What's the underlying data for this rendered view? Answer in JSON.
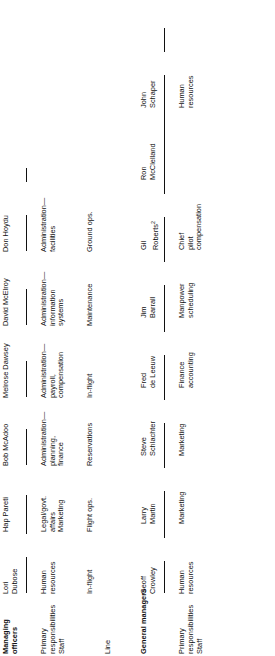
{
  "figure": {
    "type": "org-chart",
    "orientation": "rotated-90-ccw",
    "sections": [
      {
        "id": "managing-officers",
        "title": "Managing\nofficers",
        "row_labels": [
          "Primary\nresponsibilities",
          "Staff",
          "Line"
        ],
        "people": [
          {
            "name": "Lori\nDubose",
            "staff": "Human\nresources",
            "line": "In-flight"
          },
          {
            "name": "Hap Pareti",
            "staff": "Legal/govt.\naffairs\nMarketing",
            "line": "Flight ops."
          },
          {
            "name": "Bob McAdoo",
            "staff": "Administration—\nplanning,\nfinance",
            "line": "Reservations"
          },
          {
            "name": "Melrose Dawsey",
            "staff": "Administration—\npayroll,\ncompensation",
            "line": "In-flight"
          },
          {
            "name": "David McElroy",
            "staff": "Administration—\ninformation\nsystems",
            "line": "Maintenance"
          },
          {
            "name": "Don Hoydu",
            "staff": "Administration—\nfacilities",
            "line": "Ground ops."
          }
        ]
      },
      {
        "id": "general-managers",
        "title": "General managers",
        "row_labels": [
          "Primary\nresponsibilities",
          "Staff"
        ],
        "people": [
          {
            "name": "Geoff\nCrowley",
            "staff": "Human\nresources",
            "line": ""
          },
          {
            "name": "Larry\nMartin",
            "staff": "Marketing",
            "line": ""
          },
          {
            "name": "Steve\nSchlachter",
            "staff": "Marketing",
            "line": ""
          },
          {
            "name": "Fred\nde Leeuw",
            "staff": "Finance\naccounting",
            "line": ""
          },
          {
            "name": "Jim\nBarrall",
            "staff": "Manpower\nscheduling",
            "line": ""
          },
          {
            "name": "Gil\nRoberts",
            "name_superscript": "2",
            "staff": "Chief\npilot\ncompensation",
            "line": ""
          },
          {
            "name": "Ron\nMcClelland",
            "staff": "",
            "line": ""
          },
          {
            "name": "John\nSchaper",
            "staff": "Human\nresources",
            "line": ""
          }
        ]
      }
    ]
  }
}
